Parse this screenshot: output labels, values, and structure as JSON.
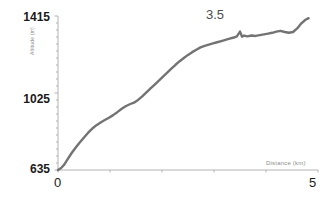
{
  "chart_data": {
    "type": "line",
    "title": "",
    "xlabel": "Distance (km)",
    "ylabel": "Altitude (m)",
    "xlim": [
      0,
      5
    ],
    "ylim": [
      635,
      1415
    ],
    "grid": false,
    "legend": null,
    "line_color": "#737373",
    "axis_color": "#b3b3b3",
    "x_ticks": [
      0,
      1,
      2,
      3,
      4,
      5
    ],
    "x_tick_labels": [
      "0",
      "",
      "",
      "",
      "",
      "5"
    ],
    "y_ticks": [
      635,
      1025,
      1415
    ],
    "y_tick_labels": [
      "635",
      "1025",
      "1415"
    ],
    "annotations": [
      {
        "text": "3.5",
        "x": 3.5,
        "y": 1415
      }
    ],
    "series": [
      {
        "name": "Elevation profile",
        "x": [
          0.0,
          0.06,
          0.12,
          0.18,
          0.25,
          0.33,
          0.41,
          0.5,
          0.58,
          0.66,
          0.74,
          0.82,
          0.9,
          0.98,
          1.06,
          1.14,
          1.22,
          1.3,
          1.38,
          1.46,
          1.54,
          1.62,
          1.7,
          1.78,
          1.86,
          1.94,
          2.02,
          2.1,
          2.18,
          2.26,
          2.34,
          2.42,
          2.5,
          2.58,
          2.66,
          2.74,
          2.82,
          2.9,
          2.98,
          3.06,
          3.14,
          3.22,
          3.3,
          3.38,
          3.44,
          3.5,
          3.54,
          3.58,
          3.64,
          3.72,
          3.8,
          3.88,
          3.96,
          4.04,
          4.12,
          4.2,
          4.28,
          4.36,
          4.44,
          4.52,
          4.6,
          4.68,
          4.76,
          4.82
        ],
        "y": [
          635,
          645,
          662,
          688,
          716,
          745,
          772,
          800,
          824,
          845,
          862,
          876,
          888,
          900,
          913,
          928,
          944,
          958,
          968,
          976,
          990,
          1008,
          1028,
          1048,
          1068,
          1088,
          1108,
          1128,
          1148,
          1168,
          1186,
          1202,
          1218,
          1232,
          1244,
          1256,
          1264,
          1270,
          1276,
          1282,
          1288,
          1294,
          1300,
          1306,
          1312,
          1336,
          1310,
          1316,
          1312,
          1316,
          1314,
          1318,
          1322,
          1326,
          1330,
          1336,
          1340,
          1334,
          1330,
          1334,
          1352,
          1378,
          1396,
          1404
        ]
      }
    ]
  }
}
